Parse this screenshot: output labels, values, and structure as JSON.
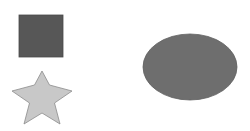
{
  "canvas": {
    "width": 250,
    "height": 131,
    "background": "#ffffff"
  },
  "shapes": [
    {
      "kind": "square",
      "x": 19,
      "y": 15,
      "width": 44,
      "height": 42,
      "fill": "#575757",
      "stroke": "#4a4a4a"
    },
    {
      "kind": "star",
      "points": "42,71 49.5,85 72,91 54.5,103 60,124 42,113 24,124 29.5,103 12,91 34.5,85",
      "fill": "#c8c8c8",
      "stroke": "#8c8c8c"
    },
    {
      "kind": "ellipse",
      "cx": 190,
      "cy": 67,
      "rx": 47,
      "ry": 33,
      "fill": "#6e6e6e",
      "stroke": "#626262"
    }
  ]
}
